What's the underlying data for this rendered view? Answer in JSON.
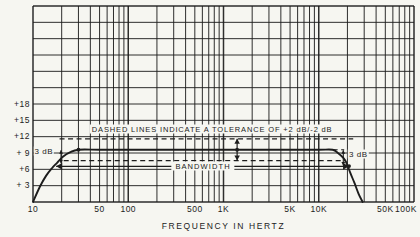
{
  "page": {
    "background": "#f6f6f1",
    "ink": "#1c1c1c"
  },
  "chart_data": {
    "type": "line",
    "title": "",
    "xlabel": "FREQUENCY IN HERTZ",
    "ylabel": "",
    "x_scale": "log",
    "x_range_hz": [
      10,
      100000
    ],
    "y_axis": {
      "unit": "dB",
      "min": 0,
      "max": 36,
      "grid_step": 3
    },
    "grid": "on",
    "x_ticks": [
      {
        "hz": 10,
        "label": "10"
      },
      {
        "hz": 50,
        "label": "50"
      },
      {
        "hz": 100,
        "label": "100"
      },
      {
        "hz": 500,
        "label": "500"
      },
      {
        "hz": 1000,
        "label": "1K"
      },
      {
        "hz": 5000,
        "label": "5K"
      },
      {
        "hz": 10000,
        "label": "10K"
      },
      {
        "hz": 50000,
        "label": "50K"
      },
      {
        "hz": 100000,
        "label": "100K"
      }
    ],
    "y_ticks": [
      {
        "db": 18,
        "label": "+18"
      },
      {
        "db": 15,
        "label": "+15"
      },
      {
        "db": 12,
        "label": "+12"
      },
      {
        "db": 9,
        "label": "+ 9"
      },
      {
        "db": 6,
        "label": "+6"
      },
      {
        "db": 3,
        "label": "+ 3"
      }
    ],
    "series": [
      {
        "name": "frequency-response",
        "style": "solid",
        "points_hz_db": [
          [
            10,
            0
          ],
          [
            11.8,
            2.8
          ],
          [
            13.7,
            4.8
          ],
          [
            15.8,
            6.2
          ],
          [
            17.9,
            7.2
          ],
          [
            20.6,
            8.3
          ],
          [
            24.4,
            9.1
          ],
          [
            30,
            9.6
          ],
          [
            50,
            9.6
          ],
          [
            100,
            9.6
          ],
          [
            500,
            9.6
          ],
          [
            1000,
            9.6
          ],
          [
            5000,
            9.6
          ],
          [
            10000,
            9.6
          ],
          [
            14000,
            9.6
          ],
          [
            15900,
            9.0
          ],
          [
            18100,
            8.1
          ],
          [
            19400,
            7.3
          ],
          [
            21500,
            5.3
          ],
          [
            23700,
            3.5
          ],
          [
            26200,
            1.5
          ],
          [
            28900,
            0
          ]
        ]
      },
      {
        "name": "tolerance-upper",
        "style": "dashed",
        "points_hz_db": [
          [
            19,
            11.6
          ],
          [
            23000,
            11.6
          ]
        ]
      },
      {
        "name": "tolerance-lower",
        "style": "dashed",
        "points_hz_db": [
          [
            21,
            7.6
          ],
          [
            19000,
            7.6
          ]
        ]
      },
      {
        "name": "flat-level-extension",
        "style": "dashed",
        "points_hz_db": [
          [
            14000,
            9.6
          ],
          [
            18500,
            9.6
          ]
        ]
      }
    ],
    "markers_hz_db": [
      [
        30,
        9.6
      ],
      [
        1390,
        9.6
      ],
      [
        20800,
        6.6
      ]
    ],
    "annotations": {
      "tolerance_note": {
        "text": "DASHED LINES INDICATE A TOLERANCE OF +2 dB/-2 dB",
        "hz": 760,
        "db": 13.5
      },
      "bandwidth": {
        "text": "BANDWIDTH",
        "hz": 610,
        "db": 6.55,
        "arrow_span_hz": [
          17.5,
          20800
        ]
      },
      "tolerance_arrow": {
        "hz": 1390,
        "db_span": [
          7.6,
          11.6
        ]
      },
      "db3_left": {
        "text": "3 dB",
        "hz": 13,
        "db": 9.3,
        "arrow_hz": 19.7,
        "arrow_db_span": [
          7.1,
          9.5
        ]
      },
      "db3_right": {
        "text": "3 dB",
        "hz": 26000,
        "db": 8.9,
        "arrow_hz": 18100,
        "arrow_db_span": [
          6.7,
          9.5
        ]
      }
    }
  }
}
